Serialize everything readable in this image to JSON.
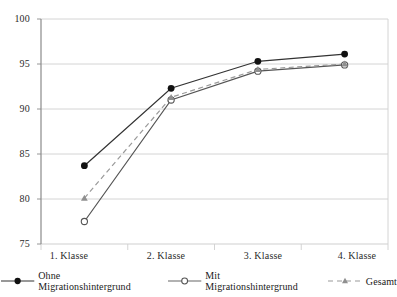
{
  "chart_data": {
    "type": "line",
    "title": "",
    "subtitle": "",
    "xlabel": "",
    "ylabel": "",
    "categories": [
      "1. Klasse",
      "2. Klasse",
      "3. Klasse",
      "4. Klasse"
    ],
    "ylim": [
      75,
      100
    ],
    "yticks": [
      75,
      80,
      85,
      90,
      95,
      100
    ],
    "grid": true,
    "grid_axis": "y",
    "legend_position": "bottom",
    "series": [
      {
        "name": "Ohne Migrationshintergrund",
        "values": [
          83.7,
          92.3,
          95.3,
          96.1
        ],
        "color": "#333333",
        "linestyle": "solid",
        "marker": "filled-circle"
      },
      {
        "name": "Mit Migrationshintergrund",
        "values": [
          77.5,
          91.0,
          94.2,
          94.9
        ],
        "color": "#555555",
        "linestyle": "solid",
        "marker": "open-circle"
      },
      {
        "name": "Gesamt",
        "values": [
          80.1,
          91.3,
          94.4,
          95.0
        ],
        "color": "#9a9a9a",
        "linestyle": "dashed",
        "marker": "triangle"
      }
    ]
  },
  "axis": {
    "y_labels": [
      "100",
      "95",
      "90",
      "85",
      "80",
      "75"
    ],
    "x_labels": [
      "1. Klasse",
      "2. Klasse",
      "3. Klasse",
      "4. Klasse"
    ]
  },
  "legend": {
    "items": [
      {
        "label": "Ohne Migrationshintergrund"
      },
      {
        "label": "Mit Migrationshintergrund"
      },
      {
        "label": "Gesamt"
      }
    ]
  },
  "colors": {
    "series1": "#333333",
    "series2": "#555555",
    "series3": "#9a9a9a",
    "grid": "#cfcfcf",
    "axis": "#8a8a8a",
    "text": "#1a1a1a",
    "background": "#ffffff"
  }
}
